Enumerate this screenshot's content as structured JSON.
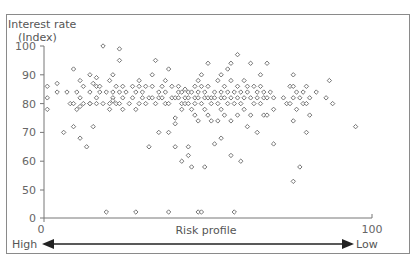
{
  "chart_data": {
    "type": "scatter",
    "title": "",
    "ylabel": "Interest rate",
    "ylabel_sub": "(Index)",
    "xlabel": "Risk profile",
    "x_axis_left_label": "High",
    "x_axis_right_label": "Low",
    "xlim": [
      0,
      100
    ],
    "ylim": [
      0,
      100
    ],
    "y_axis_break": "scale jumps from 0 to 50",
    "x_ticks": [
      "0",
      "100"
    ],
    "y_ticks": [
      "0",
      "50",
      "60",
      "70",
      "80",
      "90",
      "100"
    ],
    "grid": false,
    "legend": null,
    "marker": "small open diamond",
    "points": [
      [
        1,
        86
      ],
      [
        1,
        82
      ],
      [
        1,
        78
      ],
      [
        4,
        87
      ],
      [
        4,
        84
      ],
      [
        6,
        70
      ],
      [
        7,
        84
      ],
      [
        8,
        80
      ],
      [
        9,
        92
      ],
      [
        9,
        80
      ],
      [
        9,
        72
      ],
      [
        10,
        84
      ],
      [
        10,
        78
      ],
      [
        11,
        88
      ],
      [
        11,
        82
      ],
      [
        11,
        79
      ],
      [
        11,
        68
      ],
      [
        12,
        86
      ],
      [
        12,
        80
      ],
      [
        13,
        65
      ],
      [
        14,
        90
      ],
      [
        14,
        84
      ],
      [
        14,
        80
      ],
      [
        14,
        80
      ],
      [
        15,
        87
      ],
      [
        15,
        72
      ],
      [
        16,
        89
      ],
      [
        16,
        86
      ],
      [
        16,
        82
      ],
      [
        16,
        80
      ],
      [
        17,
        84
      ],
      [
        17,
        86
      ],
      [
        18,
        100
      ],
      [
        18,
        80
      ],
      [
        19,
        84
      ],
      [
        19,
        2
      ],
      [
        20,
        88
      ],
      [
        20,
        80
      ],
      [
        20,
        78
      ],
      [
        21,
        84
      ],
      [
        21,
        82
      ],
      [
        21,
        81
      ],
      [
        21,
        90
      ],
      [
        22,
        86
      ],
      [
        22,
        80
      ],
      [
        23,
        99
      ],
      [
        23,
        95
      ],
      [
        23,
        84
      ],
      [
        23,
        80
      ],
      [
        24,
        86
      ],
      [
        24,
        82
      ],
      [
        24,
        78
      ],
      [
        25,
        84
      ],
      [
        26,
        80
      ],
      [
        27,
        86
      ],
      [
        27,
        82
      ],
      [
        28,
        84
      ],
      [
        28,
        78
      ],
      [
        28,
        2
      ],
      [
        29,
        88
      ],
      [
        29,
        86
      ],
      [
        29,
        80
      ],
      [
        30,
        84
      ],
      [
        30,
        82
      ],
      [
        31,
        86
      ],
      [
        31,
        80
      ],
      [
        32,
        82
      ],
      [
        32,
        65
      ],
      [
        33,
        90
      ],
      [
        33,
        86
      ],
      [
        33,
        82
      ],
      [
        34,
        95
      ],
      [
        34,
        80
      ],
      [
        35,
        84
      ],
      [
        35,
        82
      ],
      [
        35,
        70
      ],
      [
        36,
        86
      ],
      [
        36,
        82
      ],
      [
        37,
        88
      ],
      [
        37,
        84
      ],
      [
        37,
        80
      ],
      [
        38,
        92
      ],
      [
        38,
        80
      ],
      [
        38,
        70
      ],
      [
        38,
        2
      ],
      [
        39,
        86
      ],
      [
        39,
        82
      ],
      [
        40,
        82
      ],
      [
        40,
        75
      ],
      [
        40,
        65
      ],
      [
        40,
        73
      ],
      [
        41,
        84
      ],
      [
        41,
        82
      ],
      [
        41,
        86
      ],
      [
        42,
        84
      ],
      [
        42,
        80
      ],
      [
        42,
        78
      ],
      [
        42,
        60
      ],
      [
        43,
        85
      ],
      [
        43,
        82
      ],
      [
        43,
        80
      ],
      [
        44,
        84
      ],
      [
        44,
        82
      ],
      [
        44,
        80
      ],
      [
        44,
        65
      ],
      [
        44,
        62
      ],
      [
        45,
        84
      ],
      [
        45,
        78
      ],
      [
        45,
        58
      ],
      [
        46,
        86
      ],
      [
        46,
        82
      ],
      [
        46,
        80
      ],
      [
        46,
        76
      ],
      [
        47,
        88
      ],
      [
        47,
        84
      ],
      [
        47,
        82
      ],
      [
        47,
        74
      ],
      [
        47,
        2
      ],
      [
        48,
        90
      ],
      [
        48,
        86
      ],
      [
        48,
        80
      ],
      [
        48,
        2
      ],
      [
        49,
        84
      ],
      [
        49,
        82
      ],
      [
        49,
        78
      ],
      [
        49,
        58
      ],
      [
        50,
        94
      ],
      [
        50,
        86
      ],
      [
        50,
        82
      ],
      [
        50,
        76
      ],
      [
        51,
        82
      ],
      [
        51,
        80
      ],
      [
        51,
        74
      ],
      [
        52,
        84
      ],
      [
        52,
        82
      ],
      [
        52,
        66
      ],
      [
        53,
        88
      ],
      [
        53,
        80
      ],
      [
        53,
        74
      ],
      [
        54,
        90
      ],
      [
        54,
        84
      ],
      [
        54,
        82
      ],
      [
        54,
        78
      ],
      [
        54,
        68
      ],
      [
        55,
        86
      ],
      [
        55,
        82
      ],
      [
        55,
        76
      ],
      [
        56,
        92
      ],
      [
        56,
        84
      ],
      [
        56,
        80
      ],
      [
        57,
        94
      ],
      [
        57,
        88
      ],
      [
        57,
        82
      ],
      [
        57,
        74
      ],
      [
        57,
        62
      ],
      [
        58,
        84
      ],
      [
        58,
        80
      ],
      [
        58,
        2
      ],
      [
        59,
        97
      ],
      [
        59,
        86
      ],
      [
        59,
        82
      ],
      [
        59,
        76
      ],
      [
        60,
        84
      ],
      [
        60,
        80
      ],
      [
        60,
        60
      ],
      [
        61,
        88
      ],
      [
        61,
        82
      ],
      [
        61,
        78
      ],
      [
        62,
        86
      ],
      [
        62,
        84
      ],
      [
        62,
        72
      ],
      [
        63,
        94
      ],
      [
        63,
        82
      ],
      [
        63,
        76
      ],
      [
        64,
        86
      ],
      [
        64,
        80
      ],
      [
        65,
        84
      ],
      [
        65,
        82
      ],
      [
        65,
        70
      ],
      [
        66,
        90
      ],
      [
        66,
        86
      ],
      [
        66,
        80
      ],
      [
        67,
        84
      ],
      [
        67,
        82
      ],
      [
        67,
        76
      ],
      [
        68,
        94
      ],
      [
        68,
        82
      ],
      [
        68,
        76
      ],
      [
        69,
        84
      ],
      [
        70,
        82
      ],
      [
        70,
        78
      ],
      [
        70,
        66
      ],
      [
        73,
        82
      ],
      [
        74,
        80
      ],
      [
        75,
        86
      ],
      [
        75,
        80
      ],
      [
        76,
        90
      ],
      [
        76,
        86
      ],
      [
        76,
        82
      ],
      [
        76,
        74
      ],
      [
        76,
        53
      ],
      [
        77,
        84
      ],
      [
        77,
        78
      ],
      [
        78,
        82
      ],
      [
        78,
        58
      ],
      [
        79,
        84
      ],
      [
        79,
        80
      ],
      [
        80,
        86
      ],
      [
        80,
        80
      ],
      [
        80,
        70
      ],
      [
        81,
        82
      ],
      [
        81,
        76
      ],
      [
        83,
        84
      ],
      [
        86,
        82
      ],
      [
        87,
        88
      ],
      [
        88,
        80
      ],
      [
        95,
        72
      ]
    ]
  },
  "axes": {
    "y_title_line1": "Interest rate",
    "y_title_line2": "(Index)",
    "x_title": "Risk profile",
    "x_min_label": "0",
    "x_max_label": "100",
    "high_label": "High",
    "low_label": "Low"
  }
}
